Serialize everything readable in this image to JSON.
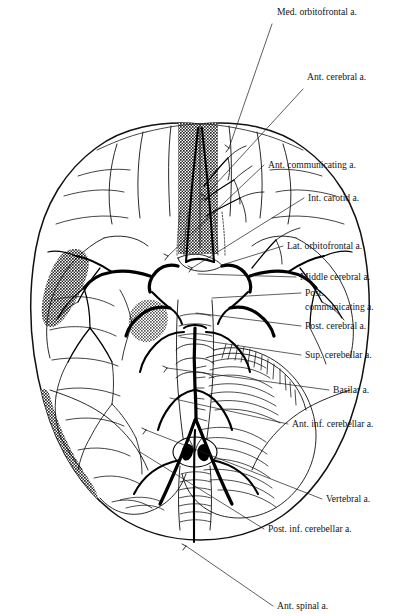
{
  "figure": {
    "background_color": "#ffffff",
    "ink_color": "#111111",
    "label_count": 14
  },
  "labels": [
    {
      "id": "med-orbitofrontal",
      "text": "Med. orbitofrontal a.",
      "x": 277,
      "y": 15,
      "line2": ""
    },
    {
      "id": "ant-cerebral",
      "text": "Ant. cerebral a.",
      "x": 307,
      "y": 80,
      "line2": ""
    },
    {
      "id": "ant-communicating",
      "text": "Ant. communicating a.",
      "x": 268,
      "y": 168,
      "line2": ""
    },
    {
      "id": "int-carotid",
      "text": "Int. carotid a.",
      "x": 308,
      "y": 201,
      "line2": ""
    },
    {
      "id": "lat-orbitofrontal",
      "text": "Lat. orbitofrontal a.",
      "x": 287,
      "y": 249,
      "line2": ""
    },
    {
      "id": "middle-cerebral",
      "text": "Middle cerebral a.",
      "x": 300,
      "y": 280,
      "line2": ""
    },
    {
      "id": "post-communicating",
      "text": "Post.",
      "x": 305,
      "y": 296,
      "line2": "communicating a."
    },
    {
      "id": "post-cerebral",
      "text": "Post. cerebral a.",
      "x": 305,
      "y": 329,
      "line2": ""
    },
    {
      "id": "sup-cerebellar",
      "text": "Sup. cerebellar a.",
      "x": 305,
      "y": 358,
      "line2": ""
    },
    {
      "id": "basilar",
      "text": "Basilar a.",
      "x": 333,
      "y": 393,
      "line2": ""
    },
    {
      "id": "ant-inf-cerebellar",
      "text": "Ant. inf. cerebellar a.",
      "x": 292,
      "y": 427,
      "line2": ""
    },
    {
      "id": "vertebral",
      "text": "Vertebral a.",
      "x": 326,
      "y": 502,
      "line2": ""
    },
    {
      "id": "post-inf-cerebellar",
      "text": "Post. inf. cerebellar a.",
      "x": 268,
      "y": 532,
      "line2": ""
    },
    {
      "id": "ant-spinal",
      "text": "Ant. spinal a.",
      "x": 277,
      "y": 609,
      "line2": ""
    }
  ],
  "leaders": [
    {
      "id": "leader-med-orbitofrontal",
      "d": "M 272 24  L 229 148"
    },
    {
      "id": "leader-ant-cerebral",
      "d": "M 303 89  L 205 196"
    },
    {
      "id": "leader-ant-communicating",
      "d": "M 264 165 L 168 256"
    },
    {
      "id": "leader-int-carotid",
      "d": "M 304 198 L 192 268"
    },
    {
      "id": "leader-lat-orbitofrontal",
      "d": "M 283 246 L 222 265"
    },
    {
      "id": "leader-middle-cerebral",
      "d": "M 296 277 L 198 274"
    },
    {
      "id": "leader-post-communicating",
      "d": "M 301 293 L 212 298"
    },
    {
      "id": "leader-post-cerebral",
      "d": "M 301 326 L 196 313"
    },
    {
      "id": "leader-sup-cerebellar",
      "d": "M 301 355 L 180 337"
    },
    {
      "id": "leader-basilar",
      "d": "M 329 390 L 167 368"
    },
    {
      "id": "leader-ant-inf-cerebellar",
      "d": "M 288 424 L 170 398"
    },
    {
      "id": "leader-vertebral",
      "d": "M 322 499 L 146 430"
    },
    {
      "id": "leader-post-inf-cerebellar",
      "d": "M 264 529 L 140 452"
    },
    {
      "id": "leader-ant-spinal",
      "d": "M 273 606 L 186 546"
    }
  ],
  "anatomy": {
    "regions": [
      {
        "id": "frontal-lobes",
        "name": "Frontal lobes"
      },
      {
        "id": "temporal-lobes",
        "name": "Temporal lobes"
      },
      {
        "id": "occipital-lobes",
        "name": "Occipital lobes"
      },
      {
        "id": "cerebellum",
        "name": "Cerebellum (folia hatching)"
      },
      {
        "id": "brainstem",
        "name": "Brainstem / pons / medulla"
      },
      {
        "id": "spinal-cord",
        "name": "Spinal cord"
      },
      {
        "id": "optic-chiasm",
        "name": "Optic nerves and chiasm"
      },
      {
        "id": "mammillary-bodies",
        "name": "Mammillary bodies"
      },
      {
        "id": "medullary-olives",
        "name": "Medullary olives"
      }
    ],
    "shaded_territories": [
      {
        "id": "shade-right-frontal",
        "name": "Medial orbitofrontal territory (right frontal band)"
      },
      {
        "id": "shade-left-temporal",
        "name": "Left temporal shaded band"
      },
      {
        "id": "shade-left-occipital",
        "name": "Left occipital shaded crescent"
      },
      {
        "id": "shade-temporal-pole",
        "name": "Temporal pole shaded patch"
      }
    ]
  }
}
